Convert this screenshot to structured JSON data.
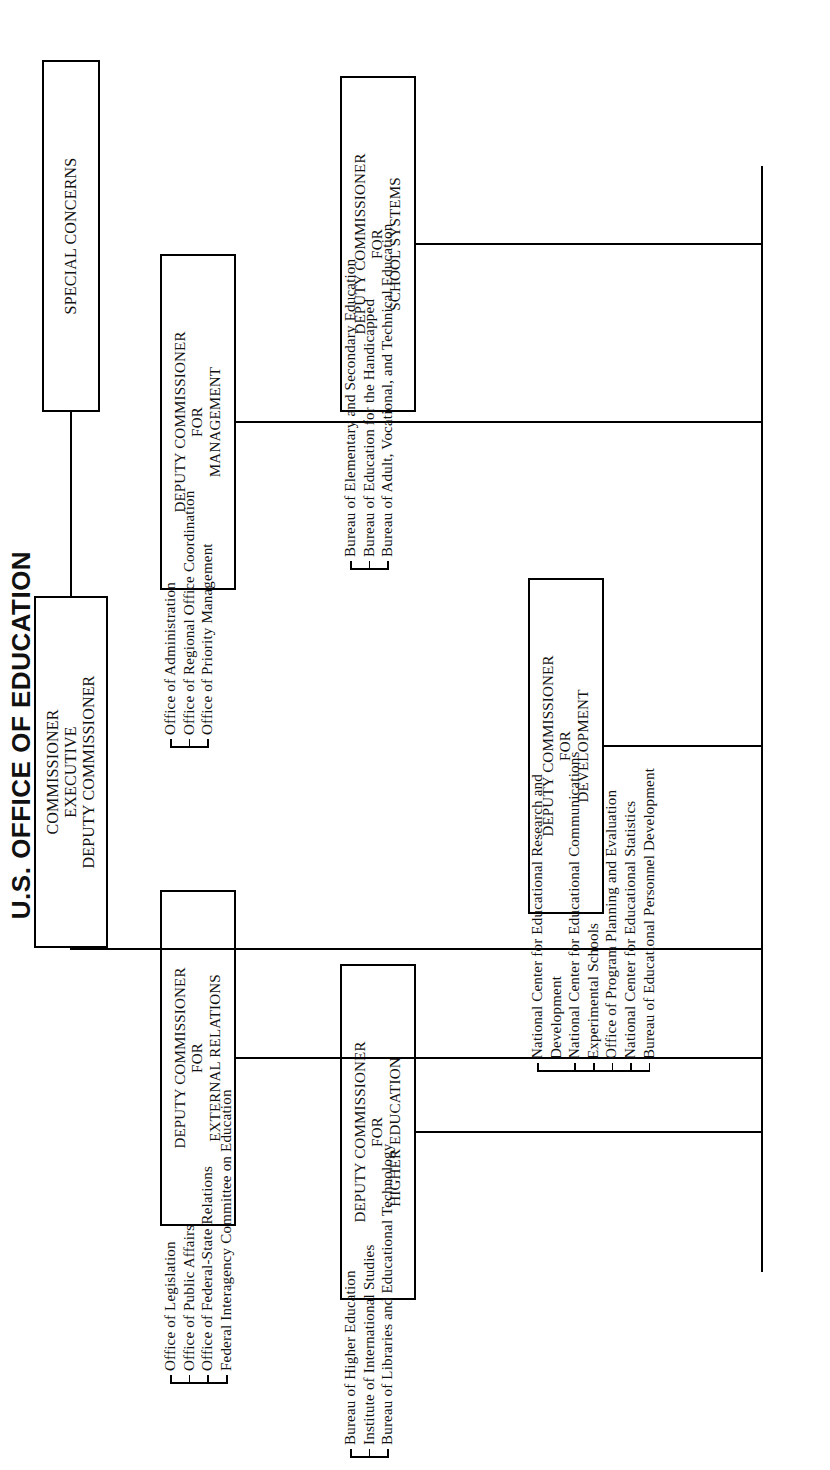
{
  "title": "U.S. OFFICE OF EDUCATION",
  "nodes": {
    "commissioner": {
      "lines": [
        "COMMISSIONER",
        "EXECUTIVE",
        "DEPUTY COMMISSIONER"
      ]
    },
    "special_concerns": {
      "lines": [
        "SPECIAL CONCERNS"
      ]
    },
    "external_relations": {
      "lines": [
        "DEPUTY COMMISSIONER",
        "FOR",
        "EXTERNAL RELATIONS"
      ],
      "items": [
        "Office of Legislation",
        "Office of Public Affairs",
        "Office of Federal-State Relations",
        "Federal Interagency Committee on Education"
      ]
    },
    "higher_education": {
      "lines": [
        "DEPUTY COMMISSIONER",
        "FOR",
        "HIGHER EDUCATION"
      ],
      "items": [
        "Bureau of Higher Education",
        "Institute of International Studies",
        "Bureau of Libraries and Educational Technology"
      ]
    },
    "development": {
      "lines": [
        "DEPUTY COMMISSIONER",
        "FOR",
        "DEVELOPMENT"
      ],
      "items": [
        "National Center for Educational Research and",
        "Development",
        "National Center for Educational Communications",
        "Experimental Schools",
        "Office of Program Planning and Evaluation",
        "National Center for Educational Statistics",
        "Bureau of Educational Personnel Development"
      ]
    },
    "school_systems": {
      "lines": [
        "DEPUTY COMMISSIONER",
        "FOR",
        "SCHOOL SYSTEMS"
      ],
      "items": [
        "Bureau of Elementary and Secondary Education",
        "Bureau of Education for the Handicapped",
        "Bureau of Adult, Vocational, and Technical Education"
      ]
    },
    "management": {
      "lines": [
        "DEPUTY COMMISSIONER",
        "FOR",
        "MANAGEMENT"
      ],
      "items": [
        "Office of Administration",
        "Office of Regional Office Coordination",
        "Office of Priority Management"
      ]
    }
  },
  "colors": {
    "ink": "#111111",
    "paper": "#ffffff",
    "rule": "#000000"
  }
}
